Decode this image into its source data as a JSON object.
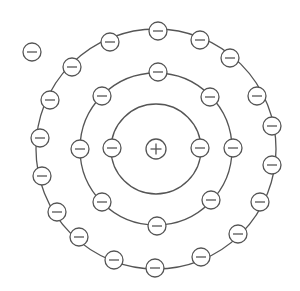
{
  "diagram": {
    "type": "bohr-atom-model",
    "canvas": {
      "width": 300,
      "height": 291,
      "background": "#ffffff"
    },
    "stroke_color": "#555555",
    "nucleus": {
      "x": 156,
      "y": 149,
      "r": 10,
      "charge_symbol": "+",
      "icon": "plus-icon"
    },
    "electron_radius": 9,
    "electron_symbol": "−",
    "shells": [
      {
        "name": "inner-shell",
        "r": 45,
        "electron_count": 2,
        "electrons": [
          [
            112,
            148
          ],
          [
            200,
            148
          ]
        ]
      },
      {
        "name": "middle-shell",
        "r": 76,
        "electron_count": 8,
        "electrons": [
          [
            158,
            72
          ],
          [
            210,
            97
          ],
          [
            233,
            148
          ],
          [
            211,
            200
          ],
          [
            157,
            226
          ],
          [
            102,
            202
          ],
          [
            80,
            149
          ],
          [
            102,
            96
          ]
        ]
      },
      {
        "name": "outer-shell",
        "r": 120,
        "electron_count": 18,
        "electrons": [
          [
            158,
            31
          ],
          [
            200,
            40
          ],
          [
            230,
            58
          ],
          [
            257,
            96
          ],
          [
            272,
            126
          ],
          [
            272,
            165
          ],
          [
            260,
            202
          ],
          [
            238,
            234
          ],
          [
            201,
            257
          ],
          [
            155,
            268
          ],
          [
            114,
            260
          ],
          [
            79,
            237
          ],
          [
            57,
            212
          ],
          [
            42,
            176
          ],
          [
            40,
            138
          ],
          [
            50,
            100
          ],
          [
            72,
            67
          ],
          [
            110,
            42
          ]
        ]
      }
    ],
    "free_electrons": [
      [
        32,
        52
      ]
    ],
    "total_electrons": 29
  }
}
